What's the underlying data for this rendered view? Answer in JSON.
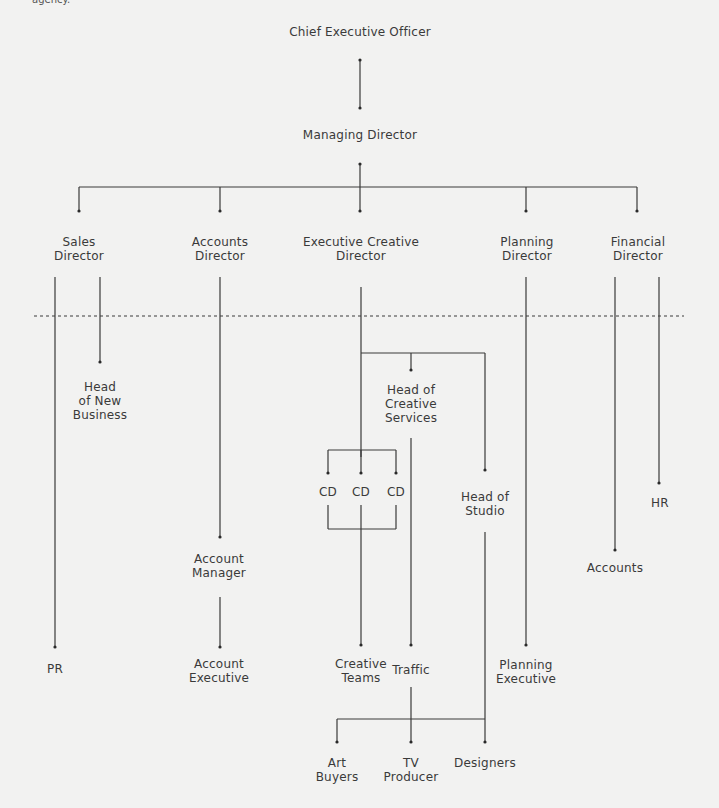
{
  "caption": "agency.",
  "colors": {
    "background": "#f2f2f1",
    "line": "#3a3a3a",
    "text": "#3a3a3a"
  },
  "nodes": {
    "ceo": "Chief Executive Officer",
    "md": "Managing Director",
    "sales_director": "Sales\nDirector",
    "accounts_director": "Accounts\nDirector",
    "ecd": "Executive Creative\nDirector",
    "planning_director": "Planning\nDirector",
    "financial_director": "Financial\nDirector",
    "head_new_business": "Head\nof New\nBusiness",
    "head_creative_services": "Head of\nCreative\nServices",
    "cd1": "CD",
    "cd2": "CD",
    "cd3": "CD",
    "head_of_studio": "Head of\nStudio",
    "hr": "HR",
    "account_manager": "Account\nManager",
    "accounts": "Accounts",
    "pr": "PR",
    "account_executive": "Account\nExecutive",
    "creative_teams": "Creative\nTeams",
    "traffic": "Traffic",
    "planning_executive": "Planning\nExecutive",
    "art_buyers": "Art\nBuyers",
    "tv_producer": "TV\nProducer",
    "designers": "Designers"
  }
}
